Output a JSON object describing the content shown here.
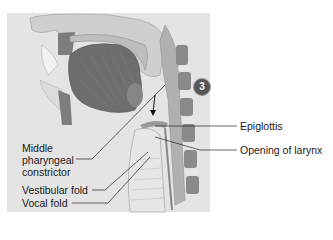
{
  "figure": {
    "step_number": "3",
    "labels_left": {
      "middle_pharyngeal": [
        "Middle",
        "pharyngeal",
        "constrictor"
      ],
      "vestibular_fold": "Vestibular fold",
      "vocal_fold": "Vocal fold"
    },
    "labels_right": {
      "epiglottis": "Epiglottis",
      "opening_of_larynx": "Opening of larynx"
    },
    "colors": {
      "panel_bg": "#e4e4e4",
      "tongue": "#6e6e6e",
      "bone": "#8a8a8a",
      "tissue": "#c8c8c8",
      "badge": "#555555"
    }
  }
}
